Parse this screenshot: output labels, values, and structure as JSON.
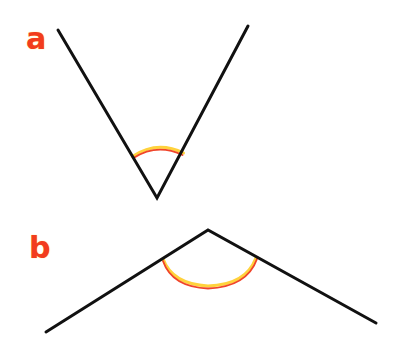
{
  "figures": [
    {
      "label": "a",
      "description": "acute angle opening upward",
      "vertex": [
        157,
        198
      ],
      "ray_ends": [
        [
          58,
          30
        ],
        [
          248,
          26
        ]
      ]
    },
    {
      "label": "b",
      "description": "obtuse angle opening downward",
      "vertex": [
        208,
        230
      ],
      "ray_ends": [
        [
          46,
          332
        ],
        [
          376,
          323
        ]
      ]
    }
  ],
  "colors": {
    "line": "#111111",
    "label": "#f23c1e",
    "arc_inner": "#f0442a",
    "arc_outer": "#ffd23c"
  }
}
